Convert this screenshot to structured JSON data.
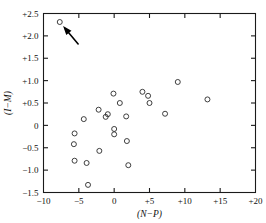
{
  "chart_data": {
    "type": "scatter",
    "title": "",
    "xlabel": "(N−P)",
    "ylabel": "(I−M)",
    "xlim": [
      -10,
      20
    ],
    "ylim": [
      -1.5,
      2.5
    ],
    "xticks": [
      -10,
      -5,
      0,
      5,
      10,
      15,
      20
    ],
    "xtick_labels": [
      "−10",
      "−5",
      "0",
      "+5",
      "+10",
      "+15",
      "+20"
    ],
    "yticks": [
      -1.5,
      -1.0,
      -0.5,
      0,
      0.5,
      1.0,
      1.5,
      2.0,
      2.5
    ],
    "ytick_labels": [
      "−1.5",
      "−1.0",
      "−0.5",
      "0",
      "+0.5",
      "+1.0",
      "+1.5",
      "+2.0",
      "+2.5"
    ],
    "grid": false,
    "legend": null,
    "marker": "open-circle",
    "points": [
      {
        "x": -7.7,
        "y": 2.31
      },
      {
        "x": -5.6,
        "y": -0.18
      },
      {
        "x": -5.7,
        "y": -0.42
      },
      {
        "x": -5.6,
        "y": -0.79
      },
      {
        "x": -4.3,
        "y": 0.14
      },
      {
        "x": -3.9,
        "y": -0.84
      },
      {
        "x": -3.7,
        "y": -1.33
      },
      {
        "x": -2.2,
        "y": 0.35
      },
      {
        "x": -2.1,
        "y": -0.57
      },
      {
        "x": -1.2,
        "y": 0.19
      },
      {
        "x": -0.9,
        "y": 0.25
      },
      {
        "x": -0.1,
        "y": 0.71
      },
      {
        "x": 0.0,
        "y": -0.08
      },
      {
        "x": 0.0,
        "y": -0.2
      },
      {
        "x": 0.8,
        "y": 0.5
      },
      {
        "x": 1.7,
        "y": 0.2
      },
      {
        "x": 1.8,
        "y": -0.35
      },
      {
        "x": 2.0,
        "y": -0.89
      },
      {
        "x": 4.0,
        "y": 0.75
      },
      {
        "x": 4.8,
        "y": 0.66
      },
      {
        "x": 5.0,
        "y": 0.5
      },
      {
        "x": 7.2,
        "y": 0.26
      },
      {
        "x": 9.0,
        "y": 0.97
      },
      {
        "x": 13.2,
        "y": 0.58
      }
    ],
    "annotations": [
      {
        "name": "outlier-arrow",
        "kind": "arrow",
        "points_to": {
          "x": -7.7,
          "y": 2.31
        },
        "tail": {
          "x": -5.1,
          "y": 1.82
        }
      }
    ]
  }
}
